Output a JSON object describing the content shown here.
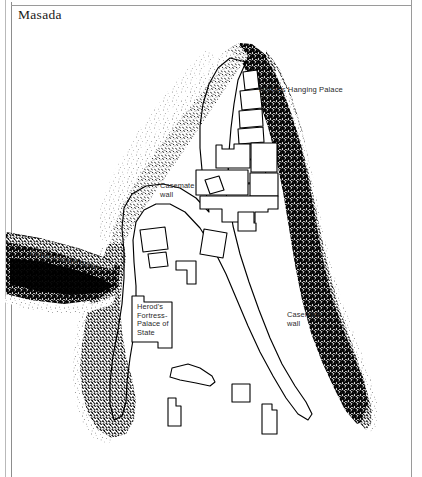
{
  "page": {
    "title": "Masada",
    "frame_color": "#9a9a9a",
    "background": "#ffffff",
    "width": 422,
    "height": 477
  },
  "map": {
    "type": "archaeological-site-plan",
    "site_name": "Masada",
    "ink_color": "#000000",
    "labels": [
      {
        "name": "herods-hanging-palace",
        "text": "Herod's Hanging Palace",
        "x": 259,
        "y": 86
      },
      {
        "name": "casemate-wall-left",
        "text": "Casemate\nwall",
        "x": 160,
        "y": 182
      },
      {
        "name": "casemate-wall-right",
        "text": "Casemate\nwall",
        "x": 287,
        "y": 311
      },
      {
        "name": "herods-fortress-palace-of-state",
        "text": "Herod's\nFortress-\nPalace of\nState",
        "x": 137,
        "y": 303
      },
      {
        "name": "roman-assault-ramp",
        "text": "Roman Assault Ramp",
        "x": 31,
        "y": 249
      }
    ],
    "features": {
      "cliff_edge": "stippled-hachure",
      "casemate_wall": "thin-outline",
      "hanging_palace": "terraced-rectangles",
      "northern_palace_complex": "rectangular-building-outlines",
      "assault_ramp": "dark-wedge-from-west"
    }
  }
}
